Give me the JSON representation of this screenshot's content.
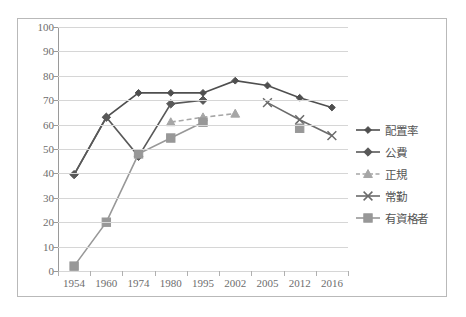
{
  "chart_data": {
    "type": "line",
    "title": "",
    "xlabel": "",
    "ylabel": "",
    "categories": [
      "1954",
      "1960",
      "1974",
      "1980",
      "1995",
      "2002",
      "2005",
      "2012",
      "2016"
    ],
    "ylim": [
      0,
      100
    ],
    "y_ticks": [
      "0",
      "10",
      "20",
      "30",
      "40",
      "50",
      "60",
      "70",
      "80",
      "90",
      "100"
    ],
    "grid": true,
    "legend_position": "right",
    "series": [
      {
        "name": "配置率",
        "marker": "diamond",
        "line_style": "solid",
        "color": "#4f4f4f",
        "values": [
          39.5,
          63,
          73,
          73,
          73,
          78,
          76,
          71,
          67
        ]
      },
      {
        "name": "公費",
        "marker": "filled-diamond",
        "line_style": "solid",
        "color": "#595959",
        "values": [
          39.5,
          63,
          47,
          68.5,
          70,
          null,
          null,
          null,
          null
        ]
      },
      {
        "name": "正規",
        "marker": "triangle",
        "line_style": "dashed",
        "color": "#a6a6a6",
        "values": [
          null,
          null,
          null,
          61,
          63,
          64.5,
          null,
          null,
          null
        ]
      },
      {
        "name": "常勤",
        "marker": "x",
        "line_style": "solid",
        "color": "#6b6b6b",
        "values": [
          null,
          null,
          null,
          null,
          null,
          null,
          69,
          62,
          55.5
        ]
      },
      {
        "name": "有資格者",
        "marker": "square",
        "line_style": "solid",
        "color": "#989898",
        "values": [
          2,
          20,
          48,
          54.5,
          61,
          null,
          null,
          58.5,
          null
        ]
      }
    ]
  },
  "legend": {
    "items": [
      {
        "label": "配置率",
        "icon": "diamond-marker-icon"
      },
      {
        "label": "公費",
        "icon": "filled-diamond-marker-icon"
      },
      {
        "label": "正規",
        "icon": "dashed-triangle-marker-icon"
      },
      {
        "label": "常勤",
        "icon": "x-marker-icon"
      },
      {
        "label": "有資格者",
        "icon": "square-marker-icon"
      }
    ]
  },
  "colors": {
    "frame_border": "#b9b9b9",
    "gridline": "#d6d6d6",
    "axis": "#9a9a9a",
    "tick_text": "#6d6d6d",
    "legend_text": "#555555"
  }
}
